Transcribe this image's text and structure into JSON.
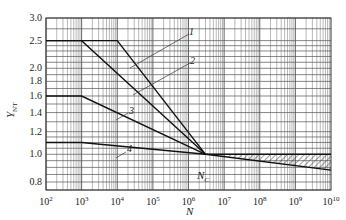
{
  "chart_data": {
    "type": "line",
    "title": "",
    "xlabel": "N",
    "ylabel": "Y_NT",
    "x_scale": "log",
    "y_scale": "log",
    "xlim": [
      100,
      10000000000
    ],
    "ylim": [
      0.75,
      3.0
    ],
    "grid": true,
    "x_ticks": [
      "10^2",
      "10^3",
      "10^4",
      "10^5",
      "10^6",
      "10^7",
      "10^8",
      "10^9",
      "10^10"
    ],
    "y_ticks": [
      "3.0",
      "2.5",
      "2.0",
      "1.8",
      "1.6",
      "1.4",
      "1.2",
      "1.0",
      "0.8"
    ],
    "annotations": [
      "1",
      "2",
      "3",
      "4",
      "N_c"
    ],
    "convergence_point": {
      "label": "N_c",
      "x": 3000000,
      "y": 1.0
    },
    "series": [
      {
        "name": "1",
        "points": [
          [
            100,
            2.5
          ],
          [
            10000,
            2.5
          ],
          [
            3000000,
            1.0
          ]
        ]
      },
      {
        "name": "2",
        "points": [
          [
            100,
            2.5
          ],
          [
            1000,
            2.5
          ],
          [
            3000000,
            1.0
          ]
        ]
      },
      {
        "name": "3",
        "points": [
          [
            100,
            1.6
          ],
          [
            1000,
            1.6
          ],
          [
            3000000,
            1.0
          ]
        ]
      },
      {
        "name": "4",
        "points": [
          [
            100,
            1.1
          ],
          [
            1000,
            1.1
          ],
          [
            3000000,
            1.0
          ]
        ]
      },
      {
        "name": "upper-limit-beyond-Nc",
        "points": [
          [
            3000000,
            1.0
          ],
          [
            10000000000,
            1.0
          ]
        ]
      },
      {
        "name": "lower-limit-beyond-Nc",
        "points": [
          [
            3000000,
            1.0
          ],
          [
            10000000000,
            0.88
          ]
        ]
      }
    ],
    "hatched_region": {
      "x_from": 10000000,
      "x_to": 10000000000,
      "between": [
        "upper-limit-beyond-Nc",
        "lower-limit-beyond-Nc"
      ]
    }
  },
  "labels": {
    "ylabel_main": "Y",
    "ylabel_sub": "NT",
    "xlabel": "N",
    "nc_main": "N",
    "nc_sub": "C",
    "curve1": "1",
    "curve2": "2",
    "curve3": "3",
    "curve4": "4",
    "yticks": [
      "3.0",
      "2.5",
      "2.0",
      "1.8",
      "1.6",
      "1.4",
      "1.2",
      "1.0",
      "0.8"
    ],
    "xtick_base": "10",
    "xtick_exps": [
      "2",
      "3",
      "4",
      "5",
      "6",
      "7",
      "8",
      "9",
      "10"
    ]
  }
}
